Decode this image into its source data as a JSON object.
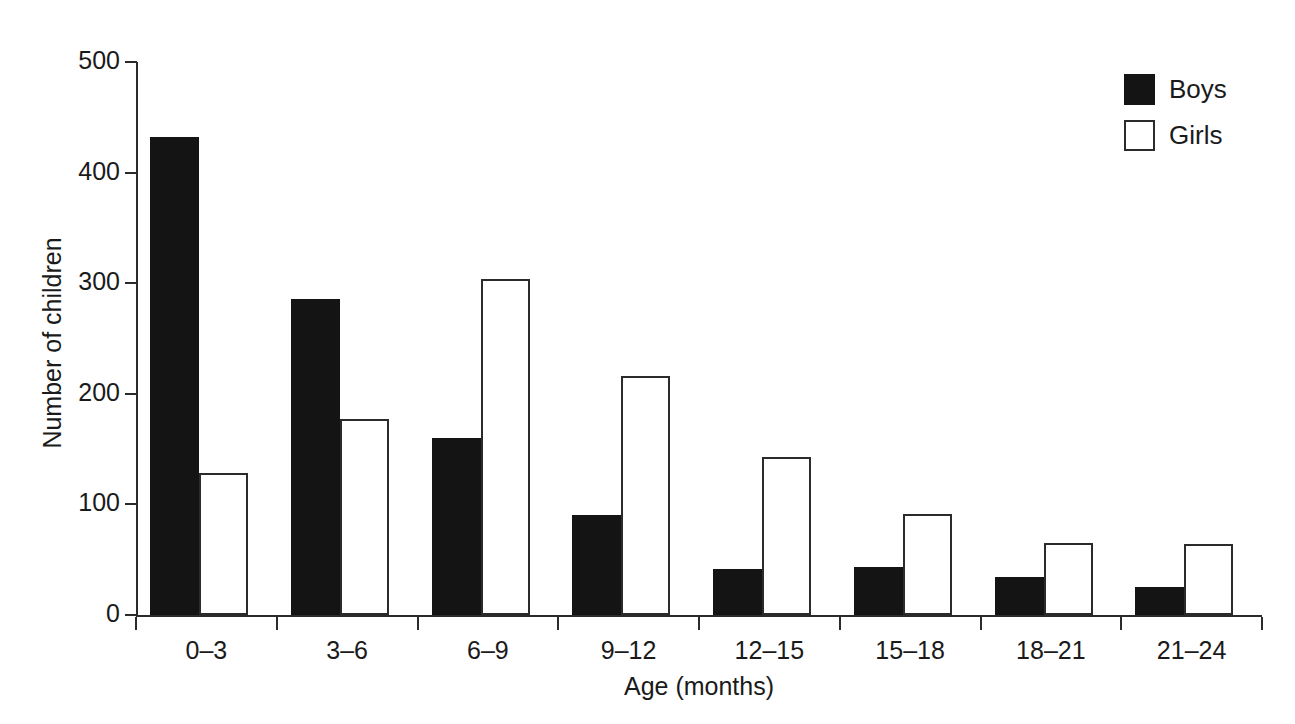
{
  "chart_data": {
    "type": "bar",
    "title": "",
    "subtitle": "",
    "xlabel": "Age (months)",
    "ylabel": "Number of children",
    "categories": [
      "0–3",
      "3–6",
      "6–9",
      "9–12",
      "12–15",
      "15–18",
      "18–21",
      "21–24"
    ],
    "series": [
      {
        "name": "Boys",
        "color": "#141414",
        "style": "filled",
        "values": [
          432,
          286,
          160,
          90,
          42,
          43,
          34,
          25
        ]
      },
      {
        "name": "Girls",
        "color": "#ffffff",
        "style": "outlined",
        "values": [
          128,
          177,
          304,
          216,
          143,
          91,
          65,
          64
        ]
      }
    ],
    "ylim": [
      0,
      500
    ],
    "ytick_values": [
      0,
      100,
      200,
      300,
      400,
      500
    ],
    "ytick_labels": [
      "0",
      "100",
      "200",
      "300",
      "400",
      "500"
    ],
    "grid": false,
    "legend_position": "top-right",
    "legend_entries": [
      "Boys",
      "Girls"
    ],
    "bar_mode": "grouped"
  },
  "axis": {
    "y_title": "Number of children",
    "x_title": "Age (months)"
  },
  "legend": {
    "boys_label": "Boys",
    "girls_label": "Girls"
  }
}
